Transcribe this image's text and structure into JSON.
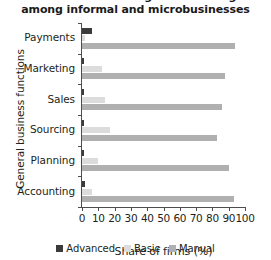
{
  "chart_data": {
    "type": "bar",
    "orientation": "horizontal",
    "title": "c. Intensive use of digital technologies\namong informal and microbusinesses",
    "xlabel": "Share of firms (%)",
    "ylabel": "General business functions",
    "categories": [
      "Payments",
      "Marketing",
      "Sales",
      "Sourcing",
      "Planning",
      "Accounting"
    ],
    "series": [
      {
        "name": "Advanced",
        "color": "#3b3b3b",
        "values": [
          6,
          1,
          1,
          1,
          1,
          2
        ]
      },
      {
        "name": "Basic",
        "color": "#dcdcdc",
        "values": [
          2,
          12,
          14,
          17,
          10,
          6
        ]
      },
      {
        "name": "Manual",
        "color": "#b0b0b0",
        "values": [
          94,
          88,
          86,
          83,
          90,
          93
        ]
      }
    ],
    "xlim": [
      0,
      100
    ],
    "xticks": [
      0,
      10,
      20,
      30,
      40,
      50,
      60,
      70,
      80,
      90,
      100
    ],
    "xticklabels": [
      "0",
      "10",
      "20",
      "30",
      "40",
      "50",
      "60",
      "70",
      "80",
      "90",
      "100"
    ],
    "grid": false,
    "legend_position": "bottom"
  }
}
